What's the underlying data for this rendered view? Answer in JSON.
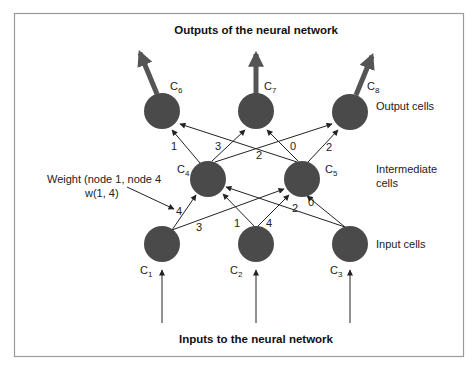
{
  "title_top": "Outputs of the neural network",
  "title_bottom": "Inputs to the neural network",
  "layer_labels": {
    "output": "Output cells",
    "intermediate_line1": "Intermediate",
    "intermediate_line2": "cells",
    "input": "Input cells"
  },
  "annotation": {
    "line1": "Weight (node 1, node 4",
    "line2": "w(1, 4)"
  },
  "colors": {
    "node": "#4a4a4a",
    "edge": "#222222",
    "frame": "#9a9a9a"
  },
  "nodes": [
    {
      "id": "C1",
      "letter": "C",
      "sub": "1",
      "layer": "input"
    },
    {
      "id": "C2",
      "letter": "C",
      "sub": "2",
      "layer": "input"
    },
    {
      "id": "C3",
      "letter": "C",
      "sub": "3",
      "layer": "input"
    },
    {
      "id": "C4",
      "letter": "C",
      "sub": "4",
      "layer": "intermediate"
    },
    {
      "id": "C5",
      "letter": "C",
      "sub": "5",
      "layer": "intermediate"
    },
    {
      "id": "C6",
      "letter": "C",
      "sub": "6",
      "layer": "output"
    },
    {
      "id": "C7",
      "letter": "C",
      "sub": "7",
      "layer": "output"
    },
    {
      "id": "C8",
      "letter": "C",
      "sub": "8",
      "layer": "output"
    }
  ],
  "edges": [
    {
      "from": "C1",
      "to": "C4",
      "weight": "4"
    },
    {
      "from": "C1",
      "to": "C5",
      "weight": "3"
    },
    {
      "from": "C2",
      "to": "C4",
      "weight": "1"
    },
    {
      "from": "C2",
      "to": "C5",
      "weight": "4"
    },
    {
      "from": "C3",
      "to": "C4",
      "weight": "2"
    },
    {
      "from": "C3",
      "to": "C5",
      "weight": "0"
    },
    {
      "from": "C4",
      "to": "C6",
      "weight": "1"
    },
    {
      "from": "C4",
      "to": "C7",
      "weight": "3"
    },
    {
      "from": "C4",
      "to": "C8",
      "weight": "2"
    },
    {
      "from": "C5",
      "to": "C6",
      "weight": ""
    },
    {
      "from": "C5",
      "to": "C7",
      "weight": "0"
    },
    {
      "from": "C5",
      "to": "C8",
      "weight": "2"
    }
  ]
}
